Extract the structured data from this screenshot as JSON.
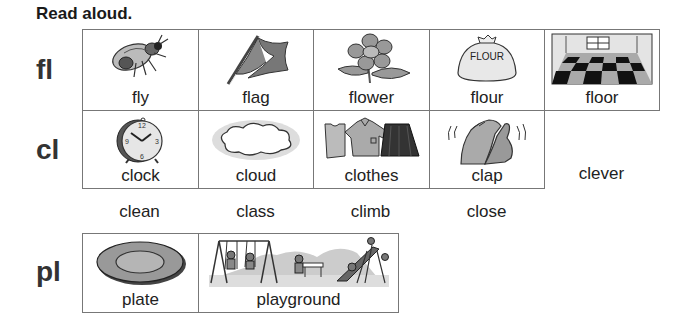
{
  "title": "Read aloud.",
  "sections": [
    {
      "blend": "fl",
      "pictures": [
        {
          "word": "fly",
          "icon": "fly-icon"
        },
        {
          "word": "flag",
          "icon": "flag-icon"
        },
        {
          "word": "flower",
          "icon": "flower-icon"
        },
        {
          "word": "flour",
          "icon": "flour-bag-icon",
          "label": "FLOUR"
        },
        {
          "word": "floor",
          "icon": "checkered-floor-icon"
        }
      ],
      "extra_words": []
    },
    {
      "blend": "cl",
      "pictures": [
        {
          "word": "clock",
          "icon": "clock-icon",
          "numerals": [
            "12",
            "3",
            "6",
            "9"
          ]
        },
        {
          "word": "cloud",
          "icon": "cloud-icon"
        },
        {
          "word": "clothes",
          "icon": "clothes-icon"
        },
        {
          "word": "clap",
          "icon": "clapping-hands-icon"
        }
      ],
      "inline_word": "clever",
      "extra_words": [
        "clean",
        "class",
        "climb",
        "close"
      ]
    },
    {
      "blend": "pl",
      "pictures": [
        {
          "word": "plate",
          "icon": "plate-icon"
        },
        {
          "word": "playground",
          "icon": "playground-icon"
        }
      ],
      "extra_words": []
    }
  ]
}
